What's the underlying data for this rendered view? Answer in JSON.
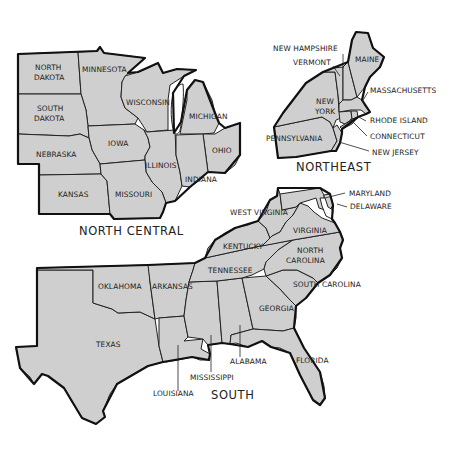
{
  "map": {
    "title": "US Census Regions (partial)",
    "fill_color": "#cfcfcf",
    "border_color": "#222222",
    "background": "#ffffff",
    "regions": [
      {
        "name": "NORTH CENTRAL",
        "states": [
          "NORTH DAKOTA",
          "MINNESOTA",
          "SOUTH DAKOTA",
          "WISCONSIN",
          "MICHIGAN",
          "IOWA",
          "NEBRASKA",
          "ILLINOIS",
          "OHIO",
          "INDIANA",
          "KANSAS",
          "MISSOURI"
        ]
      },
      {
        "name": "NORTHEAST",
        "states": [
          "NEW HAMPSHIRE",
          "VERMONT",
          "MAINE",
          "MASSACHUSETTS",
          "NEW YORK",
          "RHODE ISLAND",
          "CONNECTICUT",
          "PENNSYLVANIA",
          "NEW JERSEY"
        ]
      },
      {
        "name": "SOUTH",
        "states": [
          "MARYLAND",
          "DELAWARE",
          "WEST VIRGINIA",
          "VIRGINIA",
          "KENTUCKY",
          "NORTH CAROLINA",
          "TENNESSEE",
          "OKLAHOMA",
          "ARKANSAS",
          "SOUTH CAROLINA",
          "GEORGIA",
          "TEXAS",
          "ALABAMA",
          "LOUISIANA",
          "MISSISSIPPI",
          "FLORIDA"
        ]
      }
    ],
    "labels": {
      "nd1": "NORTH",
      "nd2": "DAKOTA",
      "mn": "MINNESOTA",
      "sd1": "SOUTH",
      "sd2": "DAKOTA",
      "wi": "WISCONSIN",
      "mi": "MICHIGAN",
      "ia": "IOWA",
      "ne": "NEBRASKA",
      "il": "ILLINOIS",
      "oh": "OHIO",
      "in": "INDIANA",
      "ks": "KANSAS",
      "mo": "MISSOURI",
      "nh": "NEW HAMPSHIRE",
      "vt": "VERMONT",
      "me": "MAINE",
      "ma": "MASSACHUSETTS",
      "ny1": "NEW",
      "ny2": "YORK",
      "ri": "RHODE ISLAND",
      "ct": "CONNECTICUT",
      "pa": "PENNSYLVANIA",
      "nj": "NEW JERSEY",
      "md": "MARYLAND",
      "de": "DELAWARE",
      "wv": "WEST VIRGINIA",
      "va": "VIRGINIA",
      "ky": "KENTUCKY",
      "nc1": "NORTH",
      "nc2": "CAROLINA",
      "tn": "TENNESSEE",
      "ok": "OKLAHOMA",
      "ar": "ARKANSAS",
      "sc": "SOUTH CAROLINA",
      "ga": "GEORGIA",
      "tx": "TEXAS",
      "al": "ALABAMA",
      "la": "LOUISIANA",
      "ms": "MISSISSIPPI",
      "fl": "FLORIDA",
      "region_nc": "NORTH CENTRAL",
      "region_ne": "NORTHEAST",
      "region_s": "SOUTH"
    }
  }
}
